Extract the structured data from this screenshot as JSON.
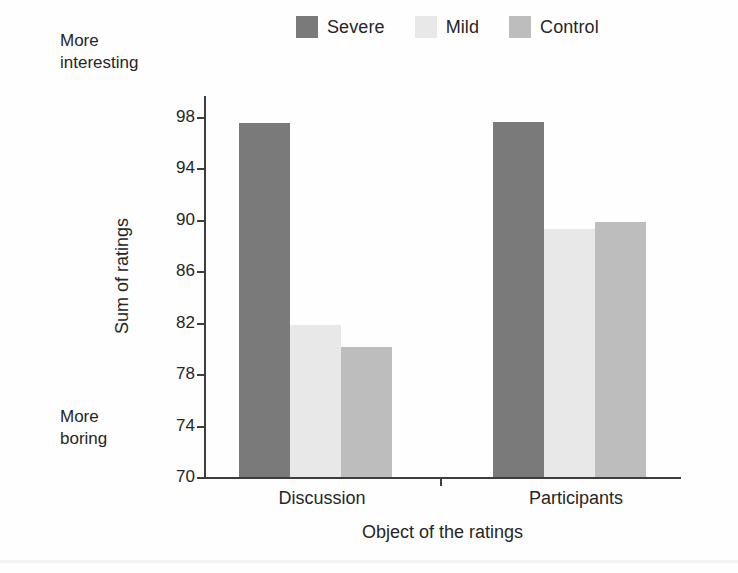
{
  "annotations": {
    "top_left": "More\ninteresting",
    "bottom_left": "More\nboring"
  },
  "axis": {
    "ylabel": "Sum of ratings",
    "xlabel": "Object of the ratings",
    "yticks": [
      "98",
      "94",
      "90",
      "86",
      "82",
      "78",
      "74",
      "70"
    ]
  },
  "legend": {
    "items": [
      {
        "label": "Severe",
        "color": "#7a7a7a"
      },
      {
        "label": "Mild",
        "color": "#e8e8e8"
      },
      {
        "label": "Control",
        "color": "#bdbdbd"
      }
    ]
  },
  "categories": [
    "Discussion",
    "Participants"
  ],
  "chart_data": {
    "type": "bar",
    "title": "",
    "subtitle": "",
    "xlabel": "Object of the ratings",
    "ylabel": "Sum of ratings",
    "categories": [
      "Discussion",
      "Participants"
    ],
    "series": [
      {
        "name": "Severe",
        "color": "#7a7a7a",
        "values": [
          97.5,
          97.6
        ]
      },
      {
        "name": "Mild",
        "color": "#e8e8e8",
        "values": [
          81.8,
          89.3
        ]
      },
      {
        "name": "Control",
        "color": "#bdbdbd",
        "values": [
          80.1,
          89.8
        ]
      }
    ],
    "ylim": [
      70,
      99.6
    ],
    "ytick_values": [
      70,
      74,
      78,
      82,
      86,
      90,
      94,
      98
    ],
    "grid": false,
    "legend_position": "top-center",
    "annotations": [
      {
        "text": "More interesting",
        "position": "top-left-of-axis"
      },
      {
        "text": "More boring",
        "position": "bottom-left-of-axis"
      }
    ]
  }
}
